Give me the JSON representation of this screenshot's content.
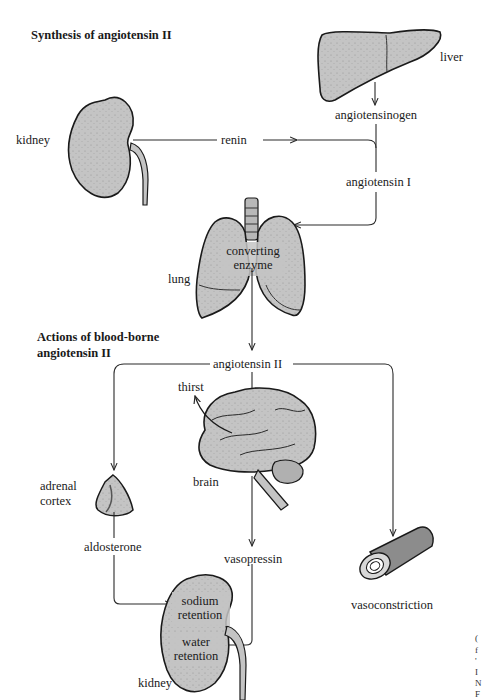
{
  "diagram": {
    "sections": {
      "synthesis": {
        "heading": "Synthesis of angiotensin II"
      },
      "actions": {
        "heading_line1": "Actions of blood-borne",
        "heading_line2": "angiotensin II"
      }
    },
    "organs": {
      "liver": "liver",
      "kidney_top": "kidney",
      "lung": "lung",
      "brain": "brain",
      "adrenal_line1": "adrenal",
      "adrenal_line2": "cortex",
      "kidney_bottom": "kidney",
      "vessel": "vasoconstriction"
    },
    "substances": {
      "angiotensinogen": "angiotensinogen",
      "renin": "renin",
      "angiotensin_I": "angiotensin I",
      "converting_enzyme_line1": "converting",
      "converting_enzyme_line2": "enzyme",
      "angiotensin_II": "angiotensin II",
      "thirst": "thirst",
      "aldosterone": "aldosterone",
      "vasopressin": "vasopressin",
      "sodium_retention_line1": "sodium",
      "sodium_retention_line2": "retention",
      "water_retention_line1": "water",
      "water_retention_line2": "retention"
    },
    "flows": [
      {
        "from": "liver",
        "to": "angiotensinogen"
      },
      {
        "from": "kidney",
        "via": "renin",
        "to": "angiotensinogen"
      },
      {
        "from": "angiotensinogen",
        "to": "angiotensin I"
      },
      {
        "from": "angiotensin I",
        "to": "lung (converting enzyme)"
      },
      {
        "from": "lung",
        "to": "angiotensin II"
      },
      {
        "from": "angiotensin II",
        "to": "adrenal cortex"
      },
      {
        "from": "angiotensin II",
        "to": "brain",
        "effect": "thirst"
      },
      {
        "from": "angiotensin II",
        "to": "vasoconstriction"
      },
      {
        "from": "adrenal cortex",
        "via": "aldosterone",
        "to": "kidney sodium retention"
      },
      {
        "from": "brain",
        "via": "vasopressin",
        "to": "kidney water retention"
      }
    ],
    "colors": {
      "organ_fill": "#c4c4c4",
      "organ_stroke": "#1a1a1a",
      "line": "#2a2a2a",
      "background": "#ffffff"
    },
    "margin_fragments": [
      "(",
      "f",
      "'",
      "I",
      "N",
      "F"
    ]
  }
}
